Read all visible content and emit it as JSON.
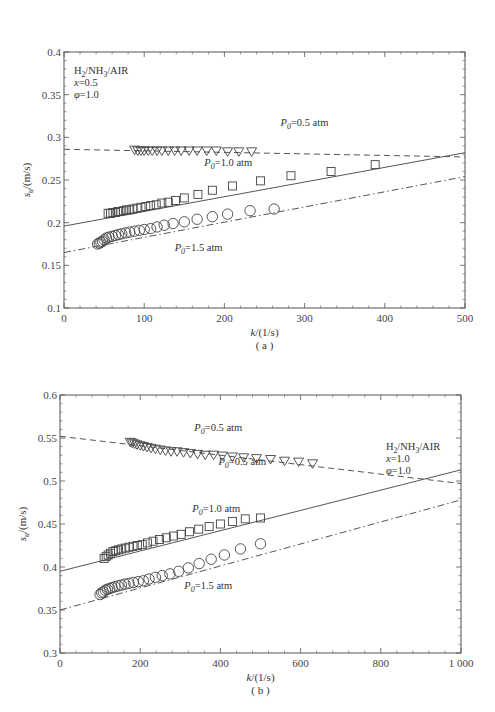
{
  "chart_data": [
    {
      "type": "scatter",
      "panel": "(a)",
      "title": "",
      "xlabel": "k/(1/s)",
      "ylabel": "s_u/(m/s)",
      "xlim": [
        0,
        500
      ],
      "ylim": [
        0.1,
        0.4
      ],
      "xticks": [
        0,
        100,
        200,
        300,
        400,
        500
      ],
      "xtick_labels": [
        "0",
        "100",
        "200",
        "300",
        "400",
        "500"
      ],
      "yticks": [
        0.1,
        0.15,
        0.2,
        0.25,
        0.3,
        0.35,
        0.4
      ],
      "ytick_labels": [
        "0.1",
        "0.15",
        "0.2",
        "0.25",
        "0.3",
        "0.35",
        "0.4"
      ],
      "grid": false,
      "annotation": [
        "H2/NH3/AIR",
        "x=0.5",
        "φ=1.0"
      ],
      "series": [
        {
          "name": "P0=0.5 atm",
          "marker": "triangle-down",
          "line": "dashed",
          "x": [
            88,
            92,
            96,
            100,
            105,
            110,
            116,
            122,
            130,
            138,
            146,
            156,
            166,
            178,
            190,
            204,
            218,
            234
          ],
          "y": [
            0.285,
            0.284,
            0.284,
            0.284,
            0.284,
            0.284,
            0.284,
            0.284,
            0.284,
            0.284,
            0.284,
            0.284,
            0.284,
            0.284,
            0.284,
            0.283,
            0.283,
            0.283
          ],
          "fit": {
            "x": [
              0,
              500
            ],
            "y": [
              0.286,
              0.277
            ]
          }
        },
        {
          "name": "P0=1.0 atm",
          "marker": "square",
          "line": "solid",
          "x": [
            55,
            58,
            61,
            64,
            67,
            70,
            74,
            78,
            82,
            86,
            91,
            96,
            102,
            108,
            115,
            122,
            130,
            139,
            150,
            167,
            185,
            210,
            245,
            283,
            333,
            388
          ],
          "y": [
            0.211,
            0.211,
            0.212,
            0.212,
            0.213,
            0.213,
            0.214,
            0.215,
            0.215,
            0.216,
            0.217,
            0.218,
            0.219,
            0.22,
            0.221,
            0.223,
            0.224,
            0.226,
            0.229,
            0.233,
            0.238,
            0.243,
            0.249,
            0.255,
            0.26,
            0.268
          ],
          "fit": {
            "x": [
              0,
              500
            ],
            "y": [
              0.196,
              0.282
            ]
          }
        },
        {
          "name": "P0=1.5 atm",
          "marker": "circle",
          "line": "dash-dot",
          "x": [
            42,
            44,
            46,
            48,
            50,
            53,
            56,
            60,
            64,
            68,
            72,
            77,
            82,
            88,
            94,
            100,
            108,
            116,
            125,
            136,
            150,
            166,
            185,
            204,
            232,
            262
          ],
          "y": [
            0.175,
            0.176,
            0.177,
            0.178,
            0.18,
            0.182,
            0.183,
            0.184,
            0.185,
            0.186,
            0.187,
            0.188,
            0.189,
            0.19,
            0.191,
            0.192,
            0.193,
            0.195,
            0.197,
            0.199,
            0.201,
            0.204,
            0.207,
            0.21,
            0.214,
            0.216
          ],
          "fit": {
            "x": [
              0,
              500
            ],
            "y": [
              0.165,
              0.254
            ]
          }
        }
      ],
      "labels": [
        {
          "text": "P0=0.5 atm",
          "x": 270,
          "y": 0.313
        },
        {
          "text": "P0=1.0 atm",
          "x": 175,
          "y": 0.266
        },
        {
          "text": "P0=1.5 atm",
          "x": 138,
          "y": 0.167
        }
      ]
    },
    {
      "type": "scatter",
      "panel": "(b)",
      "title": "",
      "xlabel": "k/(1/s)",
      "ylabel": "s_u/(m/s)",
      "xlim": [
        0,
        1000
      ],
      "ylim": [
        0.3,
        0.6
      ],
      "xticks": [
        0,
        200,
        400,
        600,
        800,
        1000
      ],
      "xtick_labels": [
        "0",
        "200",
        "400",
        "600",
        "800",
        "1 000"
      ],
      "yticks": [
        0.3,
        0.35,
        0.4,
        0.45,
        0.5,
        0.55,
        0.6
      ],
      "ytick_labels": [
        "0.3",
        "0.35",
        "0.4",
        "0.45",
        "0.5",
        "0.55",
        "0.6"
      ],
      "grid": false,
      "annotation": [
        "H2/NH3/AIR",
        "x=1.0",
        "φ=1.0"
      ],
      "series": [
        {
          "name": "P0=0.5 atm",
          "marker": "triangle-down",
          "line": "dashed",
          "x": [
            175,
            180,
            186,
            192,
            200,
            208,
            217,
            227,
            238,
            250,
            263,
            277,
            292,
            308,
            325,
            343,
            362,
            383,
            405,
            430,
            458,
            490,
            525,
            560,
            595,
            630
          ],
          "y": [
            0.545,
            0.544,
            0.543,
            0.542,
            0.541,
            0.54,
            0.539,
            0.538,
            0.537,
            0.536,
            0.535,
            0.534,
            0.534,
            0.533,
            0.532,
            0.531,
            0.53,
            0.53,
            0.529,
            0.528,
            0.527,
            0.526,
            0.525,
            0.523,
            0.522,
            0.52
          ],
          "fit": {
            "x": [
              0,
              1000
            ],
            "y": [
              0.552,
              0.497
            ]
          }
        },
        {
          "name": "P0=1.0 atm",
          "marker": "square",
          "line": "solid",
          "x": [
            110,
            115,
            120,
            126,
            132,
            139,
            146,
            154,
            163,
            172,
            182,
            193,
            205,
            218,
            232,
            248,
            265,
            283,
            302,
            323,
            346,
            372,
            400,
            430,
            462,
            500
          ],
          "y": [
            0.41,
            0.412,
            0.414,
            0.416,
            0.418,
            0.419,
            0.42,
            0.421,
            0.422,
            0.423,
            0.424,
            0.425,
            0.426,
            0.428,
            0.43,
            0.432,
            0.434,
            0.436,
            0.438,
            0.441,
            0.444,
            0.447,
            0.45,
            0.453,
            0.456,
            0.457
          ],
          "fit": {
            "x": [
              0,
              1000
            ],
            "y": [
              0.395,
              0.513
            ]
          }
        },
        {
          "name": "P0=1.5 atm",
          "marker": "circle",
          "line": "dash-dot",
          "x": [
            100,
            104,
            108,
            113,
            118,
            124,
            130,
            137,
            145,
            153,
            162,
            172,
            183,
            195,
            208,
            222,
            238,
            255,
            274,
            296,
            320,
            347,
            377,
            410,
            450,
            500
          ],
          "y": [
            0.368,
            0.37,
            0.371,
            0.373,
            0.374,
            0.375,
            0.376,
            0.377,
            0.378,
            0.379,
            0.38,
            0.381,
            0.382,
            0.383,
            0.384,
            0.386,
            0.388,
            0.39,
            0.392,
            0.395,
            0.399,
            0.404,
            0.409,
            0.414,
            0.421,
            0.427
          ],
          "fit": {
            "x": [
              0,
              1000
            ],
            "y": [
              0.35,
              0.478
            ]
          }
        }
      ],
      "labels": [
        {
          "text": "P0=0.5 atm",
          "x": 335,
          "y": 0.558
        },
        {
          "text": "P0=0.5 atm",
          "x": 395,
          "y": 0.519
        },
        {
          "text": "P0=1.0 atm",
          "x": 330,
          "y": 0.464
        },
        {
          "text": "P0=1.5 atm",
          "x": 310,
          "y": 0.374
        }
      ]
    }
  ],
  "panels": [
    {
      "caption": "( a )",
      "xlabel_text": "k/(1/s)",
      "ylabel_text": "s_u/(m/s)"
    },
    {
      "caption": "( b )",
      "xlabel_text": "k/(1/s)",
      "ylabel_text": "s_u/(m/s)"
    }
  ]
}
